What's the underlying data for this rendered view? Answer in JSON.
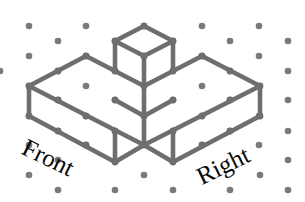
{
  "figure": {
    "line_color": "#6e6e6e",
    "dot_color": "#7a7a7a",
    "background_color": "#ffffff",
    "line_width": 4.6,
    "joint_radius": 3.4,
    "dot_radius": 3.3,
    "labels": {
      "front": "Front",
      "right": "Right"
    },
    "dots": [
      [
        29,
        26
      ],
      [
        86,
        26
      ],
      [
        202,
        26
      ],
      [
        259,
        26
      ],
      [
        58,
        41
      ],
      [
        115,
        41
      ],
      [
        173,
        41
      ],
      [
        230,
        41
      ],
      [
        288,
        41
      ],
      [
        29,
        56
      ],
      [
        86,
        56
      ],
      [
        144,
        56
      ],
      [
        202,
        56
      ],
      [
        259,
        56
      ],
      [
        0,
        71
      ],
      [
        58,
        71
      ],
      [
        115,
        71
      ],
      [
        173,
        71
      ],
      [
        230,
        71
      ],
      [
        288,
        71
      ],
      [
        29,
        86
      ],
      [
        86,
        86
      ],
      [
        202,
        86
      ],
      [
        259,
        86
      ],
      [
        58,
        100
      ],
      [
        115,
        100
      ],
      [
        173,
        100
      ],
      [
        230,
        100
      ],
      [
        288,
        100
      ],
      [
        29,
        116
      ],
      [
        86,
        116
      ],
      [
        144,
        116
      ],
      [
        202,
        116
      ],
      [
        259,
        116
      ],
      [
        58,
        131
      ],
      [
        115,
        131
      ],
      [
        173,
        131
      ],
      [
        230,
        131
      ],
      [
        288,
        131
      ],
      [
        29,
        145
      ],
      [
        86,
        145
      ],
      [
        202,
        145
      ],
      [
        259,
        145
      ],
      [
        58,
        160
      ],
      [
        288,
        160
      ],
      [
        29,
        175
      ],
      [
        144,
        175
      ],
      [
        260,
        175
      ],
      [
        58,
        190
      ],
      [
        115,
        190
      ],
      [
        173,
        190
      ],
      [
        230,
        190
      ],
      [
        288,
        190
      ]
    ],
    "edges": {
      "top_cube": [
        [
          [
            144,
            26
          ],
          [
            115,
            41
          ]
        ],
        [
          [
            144,
            26
          ],
          [
            173,
            41
          ]
        ],
        [
          [
            115,
            41
          ],
          [
            144,
            56
          ]
        ],
        [
          [
            173,
            41
          ],
          [
            144,
            56
          ]
        ],
        [
          [
            115,
            41
          ],
          [
            115,
            71
          ]
        ],
        [
          [
            173,
            41
          ],
          [
            173,
            71
          ]
        ],
        [
          [
            144,
            56
          ],
          [
            144,
            86
          ]
        ]
      ],
      "slab_top": [
        [
          [
            29,
            86
          ],
          [
            86,
            56
          ]
        ],
        [
          [
            86,
            56
          ],
          [
            115,
            71
          ]
        ],
        [
          [
            173,
            71
          ],
          [
            202,
            56
          ]
        ],
        [
          [
            202,
            56
          ],
          [
            260,
            86
          ]
        ],
        [
          [
            29,
            86
          ],
          [
            144,
            145
          ]
        ],
        [
          [
            260,
            86
          ],
          [
            144,
            145
          ]
        ],
        [
          [
            115,
            71
          ],
          [
            144,
            86
          ]
        ],
        [
          [
            144,
            86
          ],
          [
            173,
            71
          ]
        ],
        [
          [
            144,
            86
          ],
          [
            144,
            116
          ]
        ],
        [
          [
            115,
            100
          ],
          [
            144,
            116
          ]
        ],
        [
          [
            144,
            116
          ],
          [
            173,
            100
          ]
        ]
      ],
      "slab_front": [
        [
          [
            29,
            86
          ],
          [
            29,
            116
          ]
        ],
        [
          [
            260,
            86
          ],
          [
            260,
            116
          ]
        ],
        [
          [
            29,
            116
          ],
          [
            115,
            162
          ]
        ],
        [
          [
            260,
            116
          ],
          [
            173,
            162
          ]
        ],
        [
          [
            115,
            162
          ],
          [
            144,
            145
          ]
        ],
        [
          [
            144,
            145
          ],
          [
            173,
            162
          ]
        ],
        [
          [
            115,
            131
          ],
          [
            115,
            162
          ]
        ],
        [
          [
            173,
            131
          ],
          [
            173,
            162
          ]
        ],
        [
          [
            144,
            116
          ],
          [
            144,
            145
          ]
        ]
      ]
    },
    "vertices": [
      [
        144,
        26
      ],
      [
        115,
        41
      ],
      [
        173,
        41
      ],
      [
        144,
        56
      ],
      [
        115,
        71
      ],
      [
        173,
        71
      ],
      [
        144,
        86
      ],
      [
        86,
        56
      ],
      [
        202,
        56
      ],
      [
        29,
        86
      ],
      [
        260,
        86
      ],
      [
        29,
        116
      ],
      [
        260,
        116
      ],
      [
        115,
        100
      ],
      [
        173,
        100
      ],
      [
        144,
        116
      ],
      [
        115,
        131
      ],
      [
        173,
        131
      ],
      [
        115,
        162
      ],
      [
        173,
        162
      ],
      [
        144,
        145
      ],
      [
        58,
        71
      ],
      [
        58,
        100
      ],
      [
        230,
        71
      ],
      [
        230,
        100
      ],
      [
        58,
        131
      ],
      [
        230,
        131
      ],
      [
        86,
        145
      ],
      [
        202,
        145
      ],
      [
        86,
        116
      ],
      [
        202,
        116
      ]
    ]
  }
}
